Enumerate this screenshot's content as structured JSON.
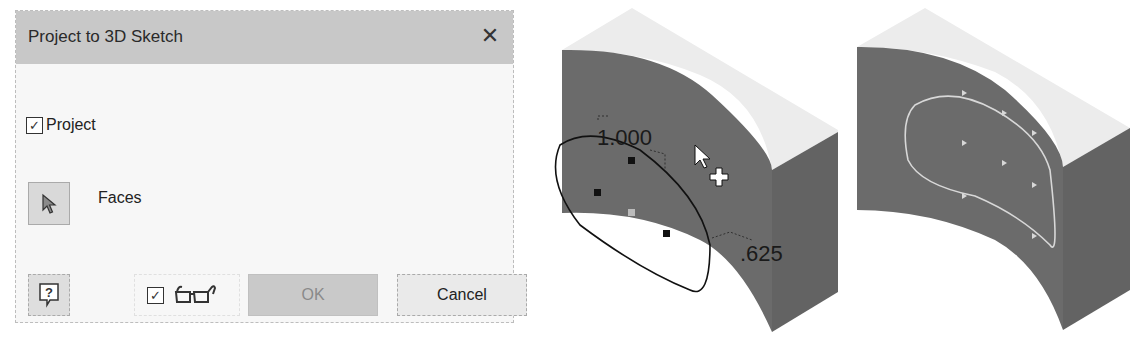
{
  "dialog": {
    "title": "Project to 3D Sketch",
    "close_icon": "close-icon",
    "project_checkbox": {
      "label": "Project",
      "checked": true
    },
    "selector": {
      "icon": "select-arrow-icon",
      "label": "Faces"
    },
    "footer": {
      "help_icon": "help-icon",
      "preview_checkbox": {
        "checked": true,
        "icon": "glasses-preview-icon"
      },
      "ok_label": "OK",
      "cancel_label": "Cancel"
    }
  },
  "viewport_before": {
    "dimension_top": "1.000",
    "dimension_right": ".625",
    "cursor_icon": "pointer-add-cursor-icon"
  },
  "viewport_after": {
    "description": "projected closed spline on curved face"
  },
  "colors": {
    "face_gray": "#6b6b6b",
    "top_light": "#ececec",
    "title_bar": "#c8c8c8",
    "ok_disabled": "#c9c9c9"
  }
}
